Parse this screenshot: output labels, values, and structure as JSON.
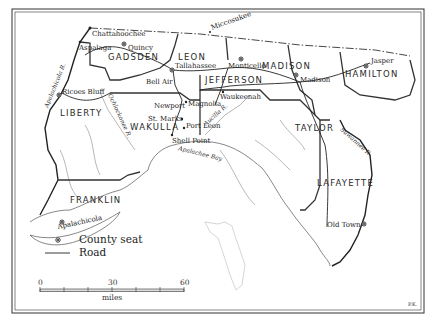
{
  "map": {
    "counties": [
      {
        "name": "GADSDEN",
        "x": 108,
        "y": 60
      },
      {
        "name": "LEON",
        "x": 178,
        "y": 60
      },
      {
        "name": "JEFFERSON",
        "x": 205,
        "y": 83
      },
      {
        "name": "MADISON",
        "x": 262,
        "y": 69
      },
      {
        "name": "HAMILTON",
        "x": 345,
        "y": 77
      },
      {
        "name": "LIBERTY",
        "x": 60,
        "y": 116
      },
      {
        "name": "WAKULLA",
        "x": 130,
        "y": 130
      },
      {
        "name": "TAYLOR",
        "x": 295,
        "y": 131
      },
      {
        "name": "FRANKLIN",
        "x": 70,
        "y": 250
      },
      {
        "name": "LAFAYETTE",
        "x": 317,
        "y": 186
      }
    ],
    "franklin_label_y": 250,
    "towns": [
      {
        "name": "Chattahoochee",
        "x": 90,
        "y": 36,
        "seat": false
      },
      {
        "name": "Aspalaga",
        "x": 79,
        "y": 48,
        "seat": false
      },
      {
        "name": "Quincy",
        "x": 128,
        "y": 50,
        "seat": true
      },
      {
        "name": "Miccosukee",
        "x": 210,
        "y": 27,
        "seat": false
      },
      {
        "name": "Tallahassee",
        "x": 173,
        "y": 71,
        "seat": true
      },
      {
        "name": "Bell Air",
        "x": 146,
        "y": 83,
        "seat": false
      },
      {
        "name": "Monticello",
        "x": 228,
        "y": 68,
        "seat": true
      },
      {
        "name": "Madison",
        "x": 300,
        "y": 82,
        "seat": true
      },
      {
        "name": "Jasper",
        "x": 370,
        "y": 63,
        "seat": true
      },
      {
        "name": "Ricoes Bluff",
        "x": 62,
        "y": 93,
        "seat": true
      },
      {
        "name": "Newport",
        "x": 154,
        "y": 105,
        "seat": false
      },
      {
        "name": "Magnolia",
        "x": 188,
        "y": 105,
        "seat": false
      },
      {
        "name": "St. Marks",
        "x": 148,
        "y": 119,
        "seat": false
      },
      {
        "name": "Port Leon",
        "x": 185,
        "y": 125,
        "seat": false
      },
      {
        "name": "Waukeenah",
        "x": 220,
        "y": 92,
        "seat": false
      },
      {
        "name": "Shell Point",
        "x": 172,
        "y": 143,
        "seat": false
      },
      {
        "name": "Apalachicola",
        "x": 60,
        "y": 225,
        "seat": true
      },
      {
        "name": "Old Town",
        "x": 327,
        "y": 227,
        "seat": true
      }
    ],
    "water_labels": [
      {
        "name": "Apalachicola R.",
        "x": 55,
        "y": 75,
        "rotate": -68
      },
      {
        "name": "Ochlockonee R.",
        "x": 110,
        "y": 110,
        "rotate": 62
      },
      {
        "name": "Aucilla R.",
        "x": 230,
        "y": 117,
        "rotate": -42
      },
      {
        "name": "Apalachee Bay",
        "x": 178,
        "y": 154,
        "rotate": 14
      },
      {
        "name": "Suwannee R.",
        "x": 350,
        "y": 148,
        "rotate": 40
      }
    ],
    "legend": {
      "county_seat": "County seat",
      "road": "Road"
    },
    "scale": {
      "ticks": [
        "0",
        "30",
        "60"
      ],
      "unit": "miles"
    },
    "credit": "P.K."
  }
}
